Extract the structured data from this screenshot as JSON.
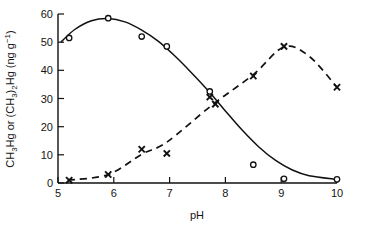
{
  "chart_data": {
    "type": "line",
    "title": "",
    "xlabel": "pH",
    "ylabel": "CH3Hg or (CH3)2Hg (ng g-1)",
    "ylabel_parts": {
      "seg1": "CH",
      "sub1": "3",
      "seg2": "Hg or (CH",
      "sub2": "3",
      "seg3": ")",
      "sub3": "2",
      "seg4": "Hg (ng g",
      "sup4": "−1",
      "seg5": ")"
    },
    "xlim": [
      5,
      10
    ],
    "ylim": [
      0,
      60
    ],
    "xticks": [
      5,
      6,
      7,
      8,
      9,
      10
    ],
    "yticks": [
      0,
      10,
      20,
      30,
      40,
      50,
      60
    ],
    "xtick_labels": [
      "5",
      "6",
      "7",
      "8",
      "9",
      "10"
    ],
    "ytick_labels": [
      "0",
      "10",
      "20",
      "30",
      "40",
      "50",
      "60"
    ],
    "grid": false,
    "legend": "none",
    "series": [
      {
        "name": "CH3Hg",
        "marker": "open-circle",
        "linestyle": "solid",
        "color": "#111111",
        "x": [
          5.2,
          5.9,
          6.5,
          6.95,
          7.72,
          8.5,
          9.05,
          10.0
        ],
        "y": [
          51.5,
          58.5,
          52.0,
          48.5,
          32.5,
          6.5,
          1.5,
          1.3
        ],
        "curve_x": [
          5.05,
          5.3,
          5.6,
          5.9,
          6.2,
          6.5,
          6.8,
          7.1,
          7.4,
          7.7,
          8.0,
          8.3,
          8.6,
          8.9,
          9.2,
          9.5,
          10.0
        ],
        "curve_y": [
          50.0,
          54.5,
          57.6,
          58.4,
          57.2,
          54.3,
          50.3,
          45.0,
          39.0,
          32.6,
          25.6,
          18.8,
          12.8,
          8.0,
          4.6,
          2.6,
          1.3
        ]
      },
      {
        "name": "(CH3)2Hg",
        "marker": "cross",
        "linestyle": "dashed",
        "color": "#111111",
        "x": [
          5.2,
          5.9,
          6.5,
          6.95,
          7.72,
          7.82,
          8.5,
          9.05,
          10.0
        ],
        "y": [
          1.0,
          3.0,
          12.0,
          10.5,
          30.5,
          28.0,
          38.0,
          48.5,
          34.0
        ],
        "curve_x": [
          5.18,
          5.9,
          6.5,
          6.95,
          7.75,
          8.5,
          9.05,
          9.5,
          10.0
        ],
        "curve_y": [
          1.0,
          3.0,
          10.2,
          14.5,
          27.5,
          38.5,
          48.3,
          45.0,
          34.0
        ]
      }
    ]
  },
  "axes": {
    "x_axis_name": "ph-axis",
    "y_axis_name": "concentration-axis"
  }
}
